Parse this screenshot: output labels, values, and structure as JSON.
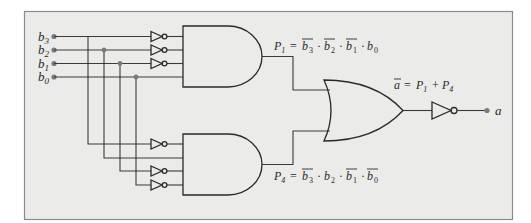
{
  "diagram": {
    "background_color": "#ebebe9",
    "border_color": "#8a8a8a",
    "inputs": [
      {
        "name": "b",
        "sub": "3"
      },
      {
        "name": "b",
        "sub": "2"
      },
      {
        "name": "b",
        "sub": "1"
      },
      {
        "name": "b",
        "sub": "0"
      }
    ],
    "gates": {
      "and_top": {
        "type": "AND",
        "inputs": [
          "NOT b3",
          "NOT b2",
          "NOT b1",
          "b0"
        ]
      },
      "and_bottom": {
        "type": "AND",
        "inputs": [
          "NOT b3",
          "b2",
          "NOT b1",
          "NOT b0"
        ]
      },
      "or": {
        "type": "OR",
        "inputs": [
          "P1",
          "P4"
        ]
      },
      "inverter_out": {
        "type": "NOT"
      }
    },
    "labels": {
      "p1": {
        "lhs": "P",
        "lhs_sub": "1",
        "eq": " = ",
        "terms": [
          {
            "var": "b",
            "sub": "3",
            "bar": true
          },
          {
            "var": "b",
            "sub": "2",
            "bar": true
          },
          {
            "var": "b",
            "sub": "1",
            "bar": true
          },
          {
            "var": "b",
            "sub": "0",
            "bar": false
          }
        ]
      },
      "p4": {
        "lhs": "P",
        "lhs_sub": "4",
        "eq": " = ",
        "terms": [
          {
            "var": "b",
            "sub": "3",
            "bar": true
          },
          {
            "var": "b",
            "sub": "2",
            "bar": false
          },
          {
            "var": "b",
            "sub": "1",
            "bar": true
          },
          {
            "var": "b",
            "sub": "0",
            "bar": true
          }
        ]
      },
      "abar": {
        "lhs": "a",
        "eq": " = ",
        "t1": "P",
        "t1_sub": "1",
        "plus": " + ",
        "t2": "P",
        "t2_sub": "4"
      },
      "output": "a",
      "dot_op": "·"
    }
  }
}
